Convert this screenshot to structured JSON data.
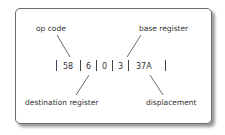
{
  "diagram": {
    "labels": {
      "op_code": "op code",
      "base_register": "base register",
      "destination_register": "destination register",
      "displacement": "displacement"
    },
    "fields": [
      "58",
      "6",
      "0",
      "3",
      "37A"
    ]
  }
}
